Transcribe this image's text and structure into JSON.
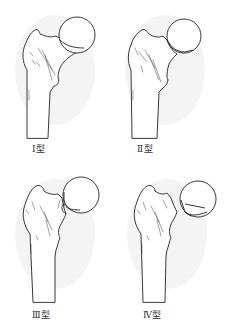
{
  "figure": {
    "panels": [
      {
        "id": "type-1",
        "label": "Ⅰ型",
        "description": "incomplete / valgus-impacted fracture"
      },
      {
        "id": "type-2",
        "label": "Ⅱ型",
        "description": "complete fracture, non-displaced"
      },
      {
        "id": "type-3",
        "label": "Ⅲ型",
        "description": "complete fracture, partially displaced"
      },
      {
        "id": "type-4",
        "label": "Ⅳ型",
        "description": "complete fracture, fully displaced"
      }
    ]
  },
  "colors": {
    "background": "#ffffff",
    "line": "#222222",
    "shadow": "#e9e9e9"
  }
}
